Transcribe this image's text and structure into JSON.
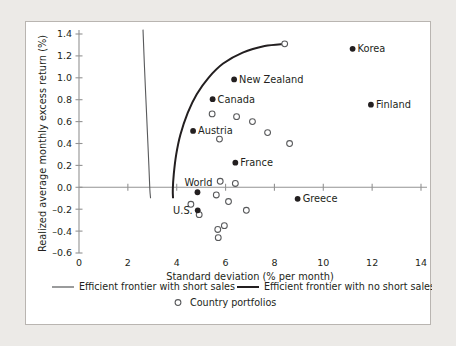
{
  "chart_data": {
    "type": "scatter",
    "title": "",
    "xlabel": "Standard deviation (% per month)",
    "ylabel": "Realized average monthly excess return (%)",
    "xlim": [
      0,
      14
    ],
    "ylim": [
      -0.6,
      1.4
    ],
    "xticks": [
      "0",
      "2",
      "4",
      "6",
      "8",
      "10",
      "12",
      "14"
    ],
    "xtick_values": [
      0,
      2,
      4,
      6,
      8,
      10,
      12,
      14
    ],
    "yticks": [
      "1.4",
      "1.2",
      "1.0",
      "0.8",
      "0.6",
      "0.4",
      "0.2",
      "0.0",
      "–0.2",
      "–0.4",
      "–0.6"
    ],
    "ytick_values": [
      1.4,
      1.2,
      1.0,
      0.8,
      0.6,
      0.4,
      0.2,
      0.0,
      -0.2,
      -0.4,
      -0.6
    ],
    "grid": false,
    "legend_position": "bottom",
    "series": [
      {
        "name": "Labeled countries",
        "marker": "filled-circle",
        "color": "#231f20",
        "points": [
          {
            "label": "Korea",
            "x": 11.2,
            "y": 1.265,
            "label_side": "right"
          },
          {
            "label": "New Zealand",
            "x": 6.35,
            "y": 0.985,
            "label_side": "right"
          },
          {
            "label": "Canada",
            "x": 5.47,
            "y": 0.805,
            "label_side": "right"
          },
          {
            "label": "Finland",
            "x": 11.95,
            "y": 0.755,
            "label_side": "right"
          },
          {
            "label": "Austria",
            "x": 4.67,
            "y": 0.515,
            "label_side": "right"
          },
          {
            "label": "France",
            "x": 6.4,
            "y": 0.225,
            "label_side": "right"
          },
          {
            "label": "World",
            "x": 4.85,
            "y": -0.045,
            "label_side": "above"
          },
          {
            "label": "Greece",
            "x": 8.95,
            "y": -0.105,
            "label_side": "right"
          },
          {
            "label": "U.S.",
            "x": 4.86,
            "y": -0.21,
            "label_side": "left"
          }
        ]
      },
      {
        "name": "Country portfolios",
        "marker": "open-circle",
        "color": "#58595b",
        "points": [
          {
            "x": 8.42,
            "y": 1.31
          },
          {
            "x": 5.45,
            "y": 0.67
          },
          {
            "x": 6.45,
            "y": 0.645
          },
          {
            "x": 7.1,
            "y": 0.6
          },
          {
            "x": 7.72,
            "y": 0.5
          },
          {
            "x": 5.75,
            "y": 0.44
          },
          {
            "x": 8.62,
            "y": 0.4
          },
          {
            "x": 5.78,
            "y": 0.055
          },
          {
            "x": 6.4,
            "y": 0.035
          },
          {
            "x": 5.62,
            "y": -0.07
          },
          {
            "x": 6.12,
            "y": -0.13
          },
          {
            "x": 4.58,
            "y": -0.155
          },
          {
            "x": 6.85,
            "y": -0.21
          },
          {
            "x": 4.92,
            "y": -0.25
          },
          {
            "x": 5.95,
            "y": -0.35
          },
          {
            "x": 5.68,
            "y": -0.385
          },
          {
            "x": 5.7,
            "y": -0.46
          }
        ]
      }
    ],
    "curves": [
      {
        "name": "Efficient frontier with short sales",
        "style": "thin",
        "color": "#58595b",
        "points": [
          [
            2.62,
            1.44
          ],
          [
            2.68,
            1.1
          ],
          [
            2.74,
            0.8
          ],
          [
            2.8,
            0.5
          ],
          [
            2.86,
            0.2
          ],
          [
            2.9,
            -0.02
          ],
          [
            2.93,
            -0.1
          ]
        ]
      },
      {
        "name": "Efficient frontier with no short sales",
        "style": "thick",
        "color": "#231f20",
        "points": [
          [
            8.42,
            1.31
          ],
          [
            7.6,
            1.29
          ],
          [
            6.7,
            1.23
          ],
          [
            5.9,
            1.13
          ],
          [
            5.3,
            1.0
          ],
          [
            4.82,
            0.85
          ],
          [
            4.45,
            0.68
          ],
          [
            4.15,
            0.48
          ],
          [
            3.98,
            0.3
          ],
          [
            3.88,
            0.12
          ],
          [
            3.84,
            -0.02
          ],
          [
            3.85,
            -0.1
          ]
        ]
      }
    ],
    "legend": [
      {
        "label": "Efficient frontier with short sales",
        "marker": "line-thin"
      },
      {
        "label": "Efficient frontier with no short sales",
        "marker": "line-thick"
      },
      {
        "label": "Country portfolios",
        "marker": "open-circle"
      }
    ]
  }
}
